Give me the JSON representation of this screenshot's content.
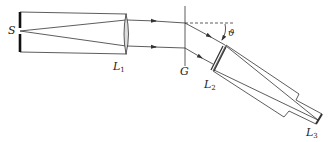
{
  "diagram": {
    "type": "grating spectrometer schematic",
    "labels": {
      "source": "S",
      "collimator_lens": "L",
      "collimator_lens_sub": "1",
      "grating": "G",
      "objective_lens": "L",
      "objective_lens_sub": "2",
      "eyepiece_lens": "L",
      "eyepiece_lens_sub": "3",
      "angle": "ϑ"
    },
    "components": [
      {
        "name": "slit",
        "label": "S"
      },
      {
        "name": "collimator",
        "label": "L1"
      },
      {
        "name": "grating",
        "label": "G"
      },
      {
        "name": "telescope-objective",
        "label": "L2"
      },
      {
        "name": "telescope-eyepiece",
        "label": "L3"
      }
    ],
    "colors": {
      "line": "#333333",
      "slit": "#111111",
      "background": "#ffffff"
    }
  }
}
